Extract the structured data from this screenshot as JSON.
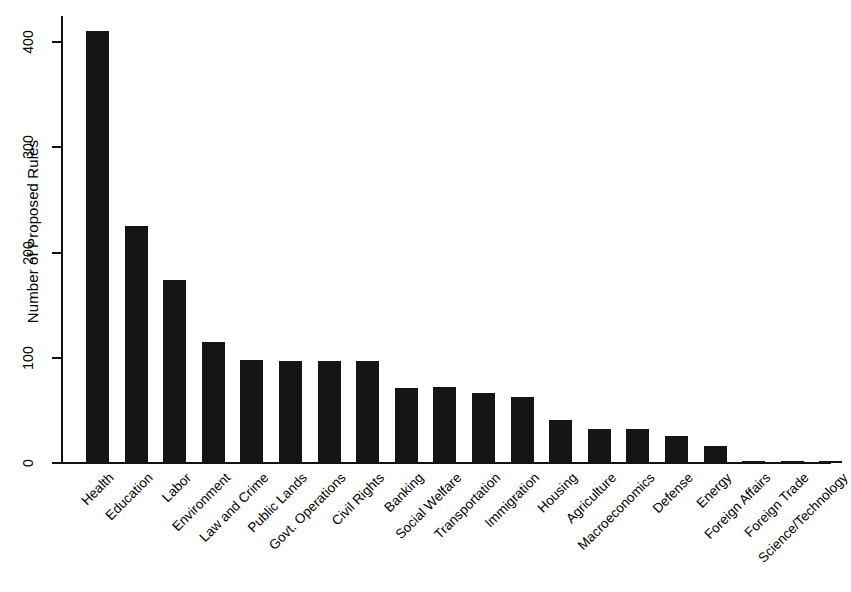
{
  "chart_data": {
    "type": "bar",
    "title": "",
    "subtitle": "",
    "xlabel": "",
    "ylabel": "Number of Proposed Rules",
    "ylim": [
      0,
      425
    ],
    "yticks": [
      0,
      100,
      200,
      300,
      400
    ],
    "ytick_labels": [
      "0",
      "100",
      "200",
      "300",
      "400"
    ],
    "grid": false,
    "legend": null,
    "bar_color": "#151515",
    "categories": [
      "Health",
      "Education",
      "Labor",
      "Environment",
      "Law and Crime",
      "Public Lands",
      "Govt. Operations",
      "Civil Rights",
      "Banking",
      "Social Welfare",
      "Transportation",
      "Immigration",
      "Housing",
      "Agriculture",
      "Macroeconomics",
      "Defense",
      "Energy",
      "Foreign Affairs",
      "Foreign Trade",
      "Science/Technology"
    ],
    "values": [
      411,
      225,
      174,
      115,
      98,
      97,
      97,
      97,
      71,
      72,
      67,
      63,
      41,
      32,
      32,
      26,
      16,
      2,
      2,
      2
    ]
  }
}
